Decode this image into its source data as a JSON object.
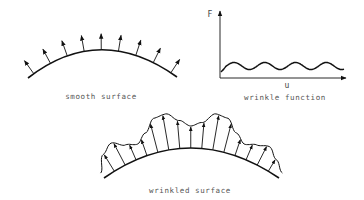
{
  "panels": {
    "smooth": {
      "label": "smooth surface",
      "arc": {
        "start": [
          28,
          78
        ],
        "control": [
          100,
          22
        ],
        "end": [
          177,
          77
        ]
      },
      "arrow_count": 9,
      "arrow_length": 16
    },
    "wrinkle_function": {
      "label": "wrinkle function",
      "y_axis_label": "F",
      "x_axis_label": "u",
      "origin": [
        220,
        78
      ],
      "x_axis_end": [
        346,
        78
      ],
      "y_axis_end": [
        220,
        11
      ],
      "wave": {
        "x_start": 221,
        "x_end": 344,
        "baseline": 66,
        "amplitude": 3.5,
        "periods": 4
      }
    },
    "wrinkled": {
      "label": "wrinkled surface",
      "arc": {
        "start": [
          104,
          178
        ],
        "control": [
          190,
          118
        ],
        "end": [
          279,
          178
        ]
      },
      "outer_offsets": [
        6,
        20,
        26,
        18,
        14,
        22,
        34,
        36,
        28,
        22,
        26,
        36,
        34,
        22,
        14,
        18,
        22,
        14,
        6
      ],
      "arrow_count": 15
    }
  },
  "colors": {
    "stroke": "#111111",
    "label": "#555555"
  }
}
